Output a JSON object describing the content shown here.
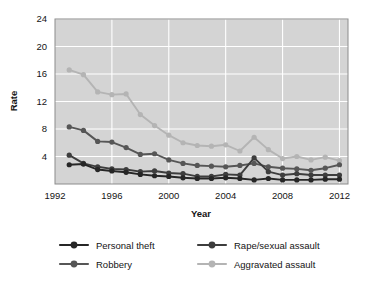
{
  "chart_data": {
    "type": "line",
    "title": "",
    "xlabel": "Year",
    "ylabel": "Rate",
    "xlim": [
      1992,
      2012.6
    ],
    "ylim": [
      0,
      24
    ],
    "grid": true,
    "legend_position": "bottom",
    "xticks": [
      "1992",
      "1996",
      "2000",
      "2004",
      "2008",
      "2012"
    ],
    "xtick_values": [
      1992,
      1996,
      2000,
      2004,
      2008,
      2012
    ],
    "yticks": [
      "4",
      "8",
      "12",
      "16",
      "20",
      "24"
    ],
    "ytick_values": [
      4,
      8,
      12,
      16,
      20,
      24
    ],
    "x": [
      1993,
      1994,
      1995,
      1996,
      1997,
      1998,
      1999,
      2000,
      2001,
      2002,
      2003,
      2004,
      2005,
      2006,
      2007,
      2008,
      2009,
      2010,
      2011,
      2012
    ],
    "series": [
      {
        "name": "Personal theft",
        "color": "#262626",
        "values": [
          2.8,
          2.9,
          2.1,
          1.9,
          1.7,
          1.4,
          1.2,
          1.1,
          0.9,
          0.8,
          0.8,
          0.9,
          0.8,
          0.6,
          0.8,
          0.6,
          0.6,
          0.6,
          0.7,
          0.7
        ]
      },
      {
        "name": "Robbery",
        "color": "#565656",
        "values": [
          8.3,
          7.8,
          6.2,
          6.1,
          5.3,
          4.3,
          4.4,
          3.5,
          3.0,
          2.7,
          2.6,
          2.5,
          2.7,
          3.0,
          2.5,
          2.3,
          2.2,
          2.0,
          2.3,
          2.8
        ]
      },
      {
        "name": "Rape/sexual assault",
        "color": "#3d3d3d",
        "values": [
          4.2,
          3.0,
          2.5,
          2.2,
          2.1,
          1.8,
          1.9,
          1.6,
          1.5,
          1.1,
          1.1,
          1.4,
          1.3,
          3.8,
          1.8,
          1.3,
          1.5,
          1.3,
          1.3,
          1.3
        ]
      },
      {
        "name": "Aggravated assault",
        "color": "#b4b4b4",
        "values": [
          16.6,
          15.9,
          13.4,
          13.0,
          13.1,
          10.1,
          8.5,
          7.1,
          6.0,
          5.6,
          5.5,
          5.7,
          4.8,
          6.8,
          5.0,
          3.7,
          4.0,
          3.5,
          3.9,
          3.4
        ]
      }
    ]
  }
}
